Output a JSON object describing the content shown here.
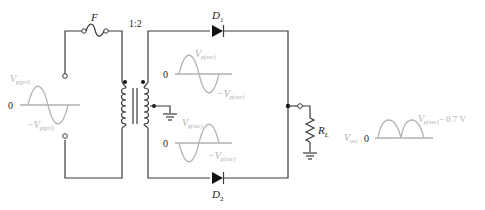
{
  "diagram": {
    "type": "center-tapped full-wave rectifier",
    "components": {
      "fuse": {
        "label": "F"
      },
      "transformer": {
        "ratio": "1:2"
      },
      "diode_top": {
        "label": "D",
        "subscript": "1"
      },
      "diode_bottom": {
        "label": "D",
        "subscript": "2"
      },
      "load": {
        "label": "R",
        "subscript": "L"
      }
    },
    "waveforms": {
      "input": {
        "zero": "0",
        "pos_label": "V",
        "pos_sub": "p(pri)",
        "neg_label": "−V",
        "neg_sub": "p(pri)"
      },
      "secondary_top": {
        "zero": "0",
        "pos_label": "V",
        "pos_sub": "p(sec)",
        "neg_label": "−V",
        "neg_sub": "p(sec)"
      },
      "secondary_bottom": {
        "zero": "0",
        "pos_label": "V",
        "pos_sub": "p(sec)",
        "neg_label": "−V",
        "neg_sub": "p(sec)"
      },
      "output": {
        "name": "V",
        "name_sub": "out",
        "zero": "0",
        "peak_label": "V",
        "peak_sub": "p(sec)",
        "peak_suffix": "− 0.7 V"
      }
    },
    "colors": {
      "wire": "#3a3a3a",
      "waveform": "#b5b5b5",
      "label_gray": "#b0b0b0"
    }
  }
}
